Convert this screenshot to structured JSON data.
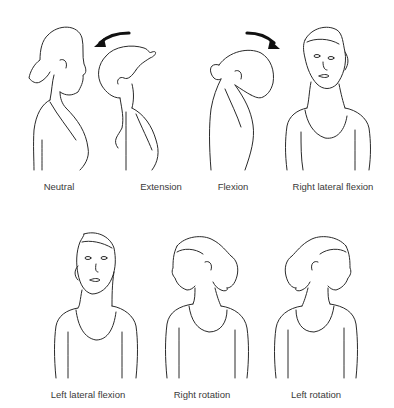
{
  "arrow_color": "#111111",
  "line_color": "#2a2a2a",
  "label_color": "#3a3a3a",
  "top_row": [
    {
      "id": "neutral",
      "label": "Neutral",
      "view": "side"
    },
    {
      "id": "extension",
      "label": "Extension",
      "view": "side",
      "arrow": "curved-left"
    },
    {
      "id": "flexion",
      "label": "Flexion",
      "view": "side",
      "arrow": "curved-right"
    },
    {
      "id": "right-lateral-flexion",
      "label": "Right lateral flexion",
      "view": "front"
    }
  ],
  "bottom_row": [
    {
      "id": "left-lateral-flexion",
      "label": "Left lateral flexion",
      "view": "front"
    },
    {
      "id": "right-rotation",
      "label": "Right rotation",
      "view": "front"
    },
    {
      "id": "left-rotation",
      "label": "Left rotation",
      "view": "front"
    }
  ]
}
